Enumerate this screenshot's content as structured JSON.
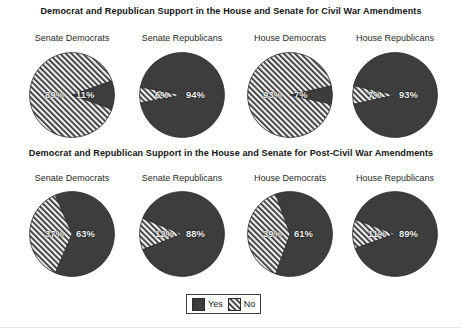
{
  "colors": {
    "yes_fill": "#3d3d3d",
    "no_fill": "#f0f0f0",
    "no_hatch": "#2e2e2e",
    "outline": "#2b2b2b",
    "value_text": "#f2f2f2",
    "background": "#ffffff"
  },
  "legend": {
    "yes_label": "Yes",
    "no_label": "No"
  },
  "rows": [
    {
      "title": "Democrat and Republican Support in the House and Senate for Civil War Amendments",
      "charts": [
        {
          "label": "Senate Democrats",
          "yes": 11,
          "no": 89,
          "yes_text": "11%",
          "no_text": "89%"
        },
        {
          "label": "Senate Republicans",
          "yes": 94,
          "no": 6,
          "yes_text": "94%",
          "no_text": "6%"
        },
        {
          "label": "House Democrats",
          "yes": 7,
          "no": 93,
          "yes_text": "7%",
          "no_text": "93%"
        },
        {
          "label": "House Republicans",
          "yes": 93,
          "no": 7,
          "yes_text": "93%",
          "no_text": "7%"
        }
      ]
    },
    {
      "title": "Democrat and Republican Support in the House and Senate for Post-Civil War Amendments",
      "charts": [
        {
          "label": "Senate Democrats",
          "yes": 63,
          "no": 37,
          "yes_text": "63%",
          "no_text": "37%"
        },
        {
          "label": "Senate Republicans",
          "yes": 88,
          "no": 12,
          "yes_text": "88%",
          "no_text": "12%"
        },
        {
          "label": "House Democrats",
          "yes": 61,
          "no": 39,
          "yes_text": "61%",
          "no_text": "39%"
        },
        {
          "label": "House Republicans",
          "yes": 89,
          "no": 11,
          "yes_text": "89%",
          "no_text": "11%"
        }
      ]
    }
  ],
  "chart_data": {
    "type": "pie",
    "legend": [
      "Yes",
      "No"
    ],
    "legend_position": "bottom-center",
    "units": "percent",
    "panels": [
      {
        "group": "Civil War Amendments",
        "panel_title": "Democrat and Republican Support in the House and Senate for Civil War Amendments",
        "pies": [
          {
            "label": "Senate Democrats",
            "categories": [
              "Yes",
              "No"
            ],
            "values": [
              11,
              89
            ]
          },
          {
            "label": "Senate Republicans",
            "categories": [
              "Yes",
              "No"
            ],
            "values": [
              94,
              6
            ]
          },
          {
            "label": "House Democrats",
            "categories": [
              "Yes",
              "No"
            ],
            "values": [
              7,
              93
            ]
          },
          {
            "label": "House Republicans",
            "categories": [
              "Yes",
              "No"
            ],
            "values": [
              93,
              7
            ]
          }
        ]
      },
      {
        "group": "Post-Civil War Amendments",
        "panel_title": "Democrat and Republican Support in the House and Senate for Post-Civil War Amendments",
        "pies": [
          {
            "label": "Senate Democrats",
            "categories": [
              "Yes",
              "No"
            ],
            "values": [
              63,
              37
            ]
          },
          {
            "label": "Senate Republicans",
            "categories": [
              "Yes",
              "No"
            ],
            "values": [
              88,
              12
            ]
          },
          {
            "label": "House Democrats",
            "categories": [
              "Yes",
              "No"
            ],
            "values": [
              61,
              39
            ]
          },
          {
            "label": "House Republicans",
            "categories": [
              "Yes",
              "No"
            ],
            "values": [
              89,
              11
            ]
          }
        ]
      }
    ]
  }
}
